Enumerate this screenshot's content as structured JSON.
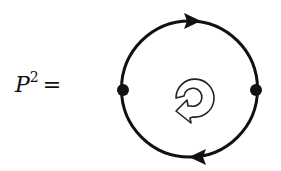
{
  "equation": {
    "symbol": "P",
    "exponent": "2",
    "equals": "="
  },
  "diagram": {
    "type": "feynman-loop",
    "loop": {
      "cx": 189.5,
      "cy": 89,
      "r": 68,
      "stroke": "#111111"
    },
    "vertices": [
      {
        "name": "left-vertex",
        "cx": 123,
        "cy": 90
      },
      {
        "name": "right-vertex",
        "cx": 256,
        "cy": 90
      }
    ],
    "arrows": [
      {
        "name": "top-arrow",
        "position": "top",
        "direction": "right"
      },
      {
        "name": "bottom-arrow",
        "position": "bottom",
        "direction": "left"
      }
    ],
    "center_icon": "clockwise-circular-arrow-icon"
  }
}
